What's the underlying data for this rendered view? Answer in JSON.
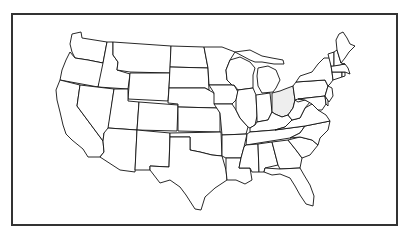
{
  "map": {
    "title": "Map of the contiguous United States",
    "highlighted_state": "Ohio",
    "colors": {
      "background": "#ffffff",
      "frame_border": "#333333",
      "state_fill": "#ffffff",
      "state_stroke": "#111111",
      "highlight_fill": "#eeeeee"
    },
    "states": [
      {
        "id": "WA",
        "name": "Washington",
        "highlighted": false
      },
      {
        "id": "OR",
        "name": "Oregon",
        "highlighted": false
      },
      {
        "id": "CA",
        "name": "California",
        "highlighted": false
      },
      {
        "id": "ID",
        "name": "Idaho",
        "highlighted": false
      },
      {
        "id": "NV",
        "name": "Nevada",
        "highlighted": false
      },
      {
        "id": "MT",
        "name": "Montana",
        "highlighted": false
      },
      {
        "id": "WY",
        "name": "Wyoming",
        "highlighted": false
      },
      {
        "id": "UT",
        "name": "Utah",
        "highlighted": false
      },
      {
        "id": "AZ",
        "name": "Arizona",
        "highlighted": false
      },
      {
        "id": "CO",
        "name": "Colorado",
        "highlighted": false
      },
      {
        "id": "NM",
        "name": "New Mexico",
        "highlighted": false
      },
      {
        "id": "ND",
        "name": "North Dakota",
        "highlighted": false
      },
      {
        "id": "SD",
        "name": "South Dakota",
        "highlighted": false
      },
      {
        "id": "NE",
        "name": "Nebraska",
        "highlighted": false
      },
      {
        "id": "KS",
        "name": "Kansas",
        "highlighted": false
      },
      {
        "id": "OK",
        "name": "Oklahoma",
        "highlighted": false
      },
      {
        "id": "TX",
        "name": "Texas",
        "highlighted": false
      },
      {
        "id": "MN",
        "name": "Minnesota",
        "highlighted": false
      },
      {
        "id": "IA",
        "name": "Iowa",
        "highlighted": false
      },
      {
        "id": "MO",
        "name": "Missouri",
        "highlighted": false
      },
      {
        "id": "AR",
        "name": "Arkansas",
        "highlighted": false
      },
      {
        "id": "LA",
        "name": "Louisiana",
        "highlighted": false
      },
      {
        "id": "WI",
        "name": "Wisconsin",
        "highlighted": false
      },
      {
        "id": "IL",
        "name": "Illinois",
        "highlighted": false
      },
      {
        "id": "MI",
        "name": "Michigan",
        "highlighted": false
      },
      {
        "id": "IN",
        "name": "Indiana",
        "highlighted": false
      },
      {
        "id": "OH",
        "name": "Ohio",
        "highlighted": true
      },
      {
        "id": "KY",
        "name": "Kentucky",
        "highlighted": false
      },
      {
        "id": "TN",
        "name": "Tennessee",
        "highlighted": false
      },
      {
        "id": "MS",
        "name": "Mississippi",
        "highlighted": false
      },
      {
        "id": "AL",
        "name": "Alabama",
        "highlighted": false
      },
      {
        "id": "GA",
        "name": "Georgia",
        "highlighted": false
      },
      {
        "id": "FL",
        "name": "Florida",
        "highlighted": false
      },
      {
        "id": "SC",
        "name": "South Carolina",
        "highlighted": false
      },
      {
        "id": "NC",
        "name": "North Carolina",
        "highlighted": false
      },
      {
        "id": "VA",
        "name": "Virginia",
        "highlighted": false
      },
      {
        "id": "WV",
        "name": "West Virginia",
        "highlighted": false
      },
      {
        "id": "PA",
        "name": "Pennsylvania",
        "highlighted": false
      },
      {
        "id": "NY",
        "name": "New York",
        "highlighted": false
      },
      {
        "id": "MD",
        "name": "Maryland",
        "highlighted": false
      },
      {
        "id": "DE",
        "name": "Delaware",
        "highlighted": false
      },
      {
        "id": "NJ",
        "name": "New Jersey",
        "highlighted": false
      },
      {
        "id": "CT",
        "name": "Connecticut",
        "highlighted": false
      },
      {
        "id": "RI",
        "name": "Rhode Island",
        "highlighted": false
      },
      {
        "id": "MA",
        "name": "Massachusetts",
        "highlighted": false
      },
      {
        "id": "VT",
        "name": "Vermont",
        "highlighted": false
      },
      {
        "id": "NH",
        "name": "New Hampshire",
        "highlighted": false
      },
      {
        "id": "ME",
        "name": "Maine",
        "highlighted": false
      }
    ]
  }
}
